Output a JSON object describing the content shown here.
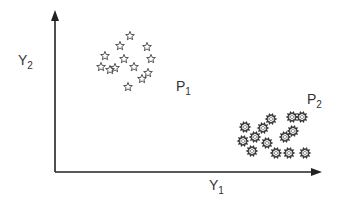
{
  "diagram": {
    "type": "scatter-clusters",
    "axis_color": "#222222",
    "marker_color": "#444444",
    "axes": {
      "x_label": "Y",
      "x_label_sub": "1",
      "y_label": "Y",
      "y_label_sub": "2"
    },
    "clusters": [
      {
        "label": "P",
        "label_sub": "1",
        "marker": "star",
        "label_pos": [
          176,
          91
        ],
        "points": [
          [
            130,
            36
          ],
          [
            120,
            46
          ],
          [
            147,
            47
          ],
          [
            105,
            56
          ],
          [
            124,
            59
          ],
          [
            151,
            59
          ],
          [
            101,
            67
          ],
          [
            110,
            70
          ],
          [
            115,
            68
          ],
          [
            134,
            67
          ],
          [
            148,
            73
          ],
          [
            142,
            79
          ],
          [
            128,
            87
          ]
        ]
      },
      {
        "label": "P",
        "label_sub": "2",
        "marker": "gear",
        "label_pos": [
          307,
          104
        ],
        "points": [
          [
            292,
            117
          ],
          [
            302,
            117
          ],
          [
            271,
            119
          ],
          [
            245,
            127
          ],
          [
            263,
            128
          ],
          [
            293,
            131
          ],
          [
            255,
            137
          ],
          [
            285,
            137
          ],
          [
            243,
            141
          ],
          [
            267,
            143
          ],
          [
            252,
            151
          ],
          [
            289,
            153
          ],
          [
            276,
            153
          ],
          [
            305,
            153
          ]
        ]
      }
    ]
  }
}
